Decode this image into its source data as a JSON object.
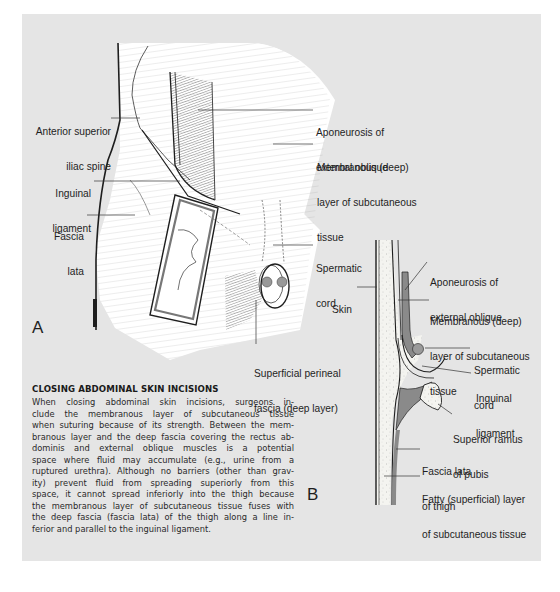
{
  "figure_a": {
    "letter": "A",
    "labels": {
      "asis": [
        "Anterior superior",
        "iliac spine"
      ],
      "inguinal_ligament": [
        "Inguinal",
        "ligament"
      ],
      "fascia_lata": [
        "Fascia",
        "lata"
      ],
      "aponeurosis": [
        "Aponeurosis of",
        "external oblique"
      ],
      "membranous": [
        "Membranous (deep)",
        "layer of subcutaneous",
        "tissue"
      ],
      "spermatic_cord": [
        "Spermatic",
        "cord"
      ],
      "perineal_fascia": [
        "Superficial perineal",
        "fascia (deep layer)"
      ]
    }
  },
  "figure_b": {
    "letter": "B",
    "labels": {
      "skin": [
        "Skin"
      ],
      "aponeurosis": [
        "Aponeurosis of",
        "external oblique"
      ],
      "membranous": [
        "Membranous (deep)",
        "layer of subcutaneous",
        "tissue"
      ],
      "spermatic_cord": [
        "Spermatic",
        "cord"
      ],
      "inguinal_ligament": [
        "Inguinal",
        "ligament"
      ],
      "superior_ramus": [
        "Superior ramus",
        "of pubis"
      ],
      "fascia_lata": [
        "Fascia lata",
        "of thigh"
      ],
      "fatty_layer": [
        "Fatty (superficial) layer",
        "of subcutaneous tissue"
      ]
    }
  },
  "note": {
    "title": "CLOSING ABDOMINAL SKIN INCISIONS",
    "lines": [
      "When closing abdominal skin incisions, surgeons in-",
      "clude the membranous layer of subcutaneous tissue",
      "when suturing because of its strength. Between the mem-",
      "branous layer and the deep fascia covering the rectus ab-",
      "dominis and external oblique muscles is a potential",
      "space where fluid may accumulate (e.g., urine from a",
      "ruptured urethra). Although no barriers (other than grav-",
      "ity) prevent fluid from spreading superiorly from this",
      "space, it cannot spread inferiorly into the thigh because",
      "the membranous layer of subcutaneous tissue fuses with",
      "the deep fascia (fascia lata) of the thigh along a line in-",
      "ferior and parallel to the inguinal ligament."
    ]
  },
  "colors": {
    "panel_bg": "#e5e5e5",
    "ink": "#1e1e1e",
    "membrane_grey": "#8a8a8a",
    "fat_fill": "#f4f4f0"
  }
}
